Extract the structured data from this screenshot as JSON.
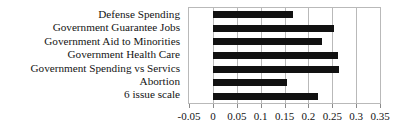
{
  "chart_data": {
    "type": "bar",
    "orientation": "horizontal",
    "title": "",
    "xlabel": "",
    "ylabel": "",
    "categories": [
      "Defense Spending",
      "Government Guarantee Jobs",
      "Government Aid to Minorities",
      "Government Health Care",
      "Government Spending vs Servics",
      "Abortion",
      "6 issue scale"
    ],
    "values": [
      0.167,
      0.254,
      0.229,
      0.262,
      0.265,
      0.156,
      0.221
    ],
    "xlim": [
      -0.05,
      0.35
    ],
    "xticks": [
      -0.05,
      0,
      0.05,
      0.1,
      0.15,
      0.2,
      0.25,
      0.3,
      0.35
    ],
    "xtick_labels": [
      "-0.05",
      "0",
      "0.05",
      "0.1",
      "0.15",
      "0.2",
      "0.25",
      "0.3",
      "0.35"
    ],
    "grid": "vertical",
    "legend": null,
    "bar_color": "#111111",
    "grid_color": "#b9b9b9",
    "background_color": "#ffffff"
  }
}
